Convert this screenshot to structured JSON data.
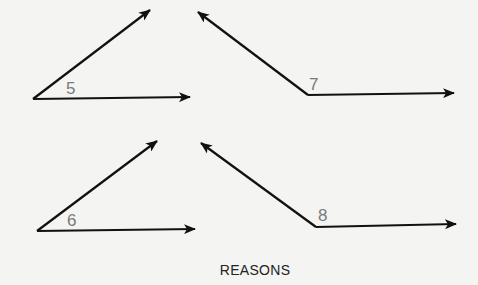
{
  "diagram": {
    "angles": [
      {
        "label": "5"
      },
      {
        "label": "7"
      },
      {
        "label": "6"
      },
      {
        "label": "8"
      }
    ],
    "caption": "REASONS"
  }
}
